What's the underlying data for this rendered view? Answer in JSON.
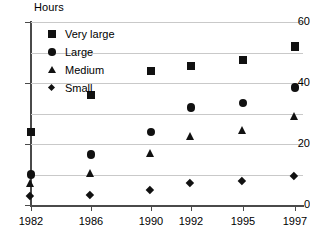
{
  "chart_data": {
    "type": "scatter",
    "title": "",
    "ylabel": "Hours",
    "xlabel": "",
    "ylim": [
      0,
      60
    ],
    "yticks": [
      0,
      20,
      40,
      60
    ],
    "grid": true,
    "legend_position": "top-left",
    "categories": [
      "1982",
      "1986",
      "1990",
      "1992",
      "1995",
      "1997"
    ],
    "series": [
      {
        "name": "Very large",
        "marker": "square",
        "values": [
          24,
          36,
          44,
          45.5,
          47.5,
          52
        ]
      },
      {
        "name": "Large",
        "marker": "circle",
        "values": [
          10,
          16.5,
          24,
          32,
          33.5,
          38.5
        ]
      },
      {
        "name": "Medium",
        "marker": "triangle",
        "values": [
          7,
          10.5,
          17,
          22.5,
          24.5,
          29
        ]
      },
      {
        "name": "Small",
        "marker": "diamond",
        "values": [
          2.5,
          3,
          4.5,
          7,
          7.5,
          9
        ]
      }
    ]
  },
  "axis": {
    "y_title": "Hours",
    "y_tick_labels": [
      "60",
      "40",
      "20",
      "0"
    ],
    "x_tick_labels": [
      "1982",
      "1986",
      "1990",
      "1992",
      "1995",
      "1997"
    ]
  },
  "legend": {
    "items": [
      {
        "label": "Very large"
      },
      {
        "label": "Large"
      },
      {
        "label": "Medium"
      },
      {
        "label": "Small"
      }
    ]
  }
}
